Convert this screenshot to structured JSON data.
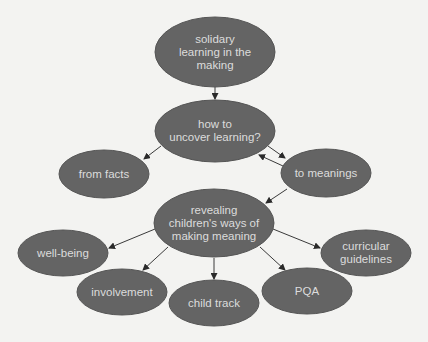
{
  "diagram": {
    "title": "solidary learning in the making",
    "colors": {
      "background": "#f3f3f1",
      "node_fill": "#646464",
      "node_stroke": "#555555",
      "text": "#dcdcdc",
      "edge": "#3a3a3a"
    },
    "nodes": [
      {
        "id": "solidary",
        "label": "solidary\nlearning in the\nmaking",
        "cx": 215,
        "cy": 52,
        "rx": 60,
        "ry": 35
      },
      {
        "id": "how",
        "label": "how to\nuncover learning?",
        "cx": 215,
        "cy": 131,
        "rx": 60,
        "ry": 31
      },
      {
        "id": "facts",
        "label": "from facts",
        "cx": 104,
        "cy": 174,
        "rx": 45,
        "ry": 24
      },
      {
        "id": "meanings",
        "label": "to meanings",
        "cx": 326,
        "cy": 173,
        "rx": 45,
        "ry": 24
      },
      {
        "id": "revealing",
        "label": "revealing\nchildren's ways of\nmaking meaning",
        "cx": 214,
        "cy": 223,
        "rx": 60,
        "ry": 34
      },
      {
        "id": "wellbeing",
        "label": "well-being",
        "cx": 63,
        "cy": 253,
        "rx": 45,
        "ry": 23
      },
      {
        "id": "involvement",
        "label": "involvement",
        "cx": 122,
        "cy": 292,
        "rx": 45,
        "ry": 23
      },
      {
        "id": "childtrack",
        "label": "child track",
        "cx": 214,
        "cy": 303,
        "rx": 45,
        "ry": 23
      },
      {
        "id": "pqa",
        "label": "PQA",
        "cx": 307,
        "cy": 291,
        "rx": 45,
        "ry": 23
      },
      {
        "id": "curricular",
        "label": "curricular\nguidelines",
        "cx": 366,
        "cy": 253,
        "rx": 45,
        "ry": 23
      }
    ],
    "edges": [
      {
        "from": "solidary",
        "to": "how",
        "x1": 215,
        "y1": 87,
        "x2": 215,
        "y2": 99
      },
      {
        "from": "how",
        "to": "facts",
        "x1": 161,
        "y1": 146,
        "x2": 144,
        "y2": 159
      },
      {
        "from": "how",
        "to": "meanings",
        "x1": 268,
        "y1": 146,
        "x2": 285,
        "y2": 158
      },
      {
        "from": "meanings",
        "to": "how",
        "x1": 283,
        "y1": 166,
        "x2": 259,
        "y2": 155
      },
      {
        "from": "meanings",
        "to": "revealing",
        "x1": 287,
        "y1": 189,
        "x2": 266,
        "y2": 203
      },
      {
        "from": "revealing",
        "to": "wellbeing",
        "x1": 155,
        "y1": 229,
        "x2": 109,
        "y2": 248
      },
      {
        "from": "revealing",
        "to": "involvement",
        "x1": 168,
        "y1": 247,
        "x2": 143,
        "y2": 270
      },
      {
        "from": "revealing",
        "to": "childtrack",
        "x1": 214,
        "y1": 258,
        "x2": 214,
        "y2": 279
      },
      {
        "from": "revealing",
        "to": "pqa",
        "x1": 260,
        "y1": 247,
        "x2": 285,
        "y2": 270
      },
      {
        "from": "revealing",
        "to": "curricular",
        "x1": 273,
        "y1": 229,
        "x2": 320,
        "y2": 248
      }
    ]
  }
}
